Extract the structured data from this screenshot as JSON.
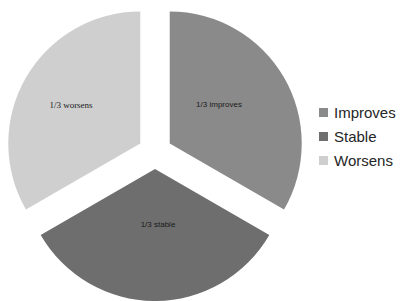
{
  "chart_data": {
    "type": "pie",
    "title": "",
    "subtitle": "",
    "xlabel": "",
    "ylabel": "",
    "grid": false,
    "exploded": true,
    "legend_position": "right",
    "categories": [
      "Improves",
      "Stable",
      "Worsens"
    ],
    "values": [
      33.3333,
      33.3333,
      33.3333
    ],
    "value_labels": [
      "1/3",
      "1/3",
      "1/3"
    ],
    "slices": [
      {
        "name": "Improves",
        "label": "1/3 improves",
        "value": 33.3333,
        "fraction": "1/3",
        "color": "#8a8a8a",
        "start_angle_deg": 0,
        "end_angle_deg": 120
      },
      {
        "name": "Stable",
        "label": "1/3 stable",
        "value": 33.3333,
        "fraction": "1/3",
        "color": "#6e6e6e",
        "start_angle_deg": 120,
        "end_angle_deg": 240
      },
      {
        "name": "Worsens",
        "label": "1/3 worsens",
        "value": 33.3333,
        "fraction": "1/3",
        "color": "#cfcfcf",
        "start_angle_deg": 240,
        "end_angle_deg": 360
      }
    ]
  },
  "legend": {
    "items": [
      {
        "label": "Improves",
        "color": "#8a8a8a"
      },
      {
        "label": "Stable",
        "color": "#6e6e6e"
      },
      {
        "label": "Worsens",
        "color": "#cfcfcf"
      }
    ]
  },
  "colors": {
    "background": "#ffffff",
    "improves": "#8a8a8a",
    "stable": "#6e6e6e",
    "worsens": "#cfcfcf",
    "label_text": "#1a1a1a",
    "legend_text": "#262626"
  }
}
